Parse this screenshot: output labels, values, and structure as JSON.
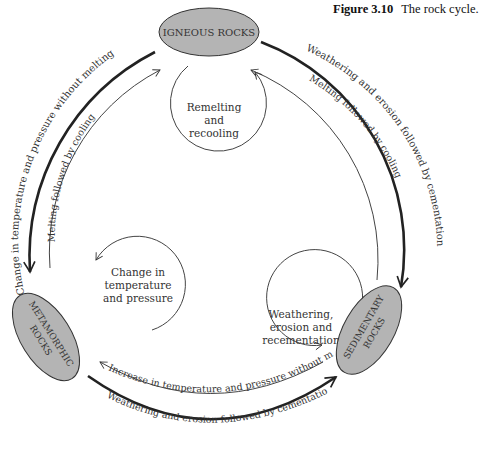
{
  "caption": {
    "figure_label": "Figure 3.10",
    "title": "The rock cycle."
  },
  "nodes": {
    "igneous": {
      "label": "IGNEOUS ROCKS"
    },
    "metamorphic": {
      "line1": "METAMORPHIC",
      "line2": "ROCKS"
    },
    "sedimentary": {
      "line1": "SEDIMENTARY",
      "line2": "ROCKS"
    }
  },
  "loops": {
    "igneous": {
      "line1": "Remelting",
      "line2": "and",
      "line3": "recooling"
    },
    "metamorphic": {
      "line1": "Change in",
      "line2": "temperature",
      "line3": "and pressure"
    },
    "sedimentary": {
      "line1": "Weathering,",
      "line2": "erosion and",
      "line3": "recementation"
    }
  },
  "arrows": {
    "igneous_to_metamorphic": "Change in temperature and pressure without melting",
    "metamorphic_to_igneous": "Melting followed by cooling",
    "igneous_to_sedimentary": "Weathering and erosion followed by cementation",
    "sedimentary_to_igneous": "Melting followed by cooling",
    "sedimentary_to_metamorphic": "Increase in temperature and pressure without melting",
    "metamorphic_to_sedimentary": "Weathering and erosion followed by cementation"
  },
  "colors": {
    "node_fill": "#b4b4b4",
    "stroke": "#333333",
    "background": "#ffffff"
  }
}
